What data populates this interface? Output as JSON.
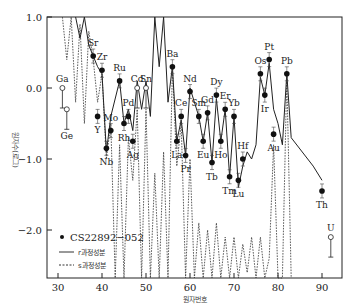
{
  "chart_data": {
    "type": "scatter",
    "title": "",
    "xlabel": "원자번호",
    "ylabel": "원자수(로그)",
    "xlim": [
      28,
      95
    ],
    "ylim": [
      -2.7,
      1.0
    ],
    "x_ticks": [
      30,
      40,
      50,
      60,
      70,
      80,
      90
    ],
    "y_ticks": [
      1.0,
      0.0,
      -1.0,
      -2.0
    ],
    "y_tick_labels": [
      "1.0",
      "0.0",
      "−1.0",
      "−2.0"
    ],
    "grid": false,
    "legend": {
      "position": "lower-left",
      "entries": [
        {
          "label": "CS22892−052",
          "style": "filled-dot"
        },
        {
          "label": "r과정성분",
          "style": "solid-line"
        },
        {
          "label": "s과정성분",
          "style": "dashed-line"
        }
      ]
    },
    "series": [
      {
        "name": "CS22892−052",
        "points": [
          {
            "el": "Ga",
            "z": 31,
            "v": 0.0,
            "open": true
          },
          {
            "el": "Ge",
            "z": 32,
            "v": -0.3,
            "open": true
          },
          {
            "el": "Sr",
            "z": 38,
            "v": 0.45
          },
          {
            "el": "Y",
            "z": 39,
            "v": -0.4
          },
          {
            "el": "Zr",
            "z": 40,
            "v": 0.25
          },
          {
            "el": "Nb",
            "z": 41,
            "v": -0.85
          },
          {
            "el": "Mo",
            "z": 42,
            "v": -0.6
          },
          {
            "el": "Ru",
            "z": 44,
            "v": 0.1
          },
          {
            "el": "Rh",
            "z": 45,
            "v": -0.5
          },
          {
            "el": "Pd",
            "z": 46,
            "v": -0.4
          },
          {
            "el": "Ag",
            "z": 47,
            "v": -0.75
          },
          {
            "el": "Cd",
            "z": 48,
            "v": 0.0,
            "open": true
          },
          {
            "el": "Sn",
            "z": 50,
            "v": 0.0,
            "open": true
          },
          {
            "el": "Ba",
            "z": 56,
            "v": 0.3
          },
          {
            "el": "La",
            "z": 57,
            "v": -0.75
          },
          {
            "el": "Ce",
            "z": 58,
            "v": -0.4
          },
          {
            "el": "Pr",
            "z": 59,
            "v": -0.95
          },
          {
            "el": "Nd",
            "z": 60,
            "v": -0.05
          },
          {
            "el": "Sm",
            "z": 62,
            "v": -0.4
          },
          {
            "el": "Eu",
            "z": 63,
            "v": -0.75
          },
          {
            "el": "Gd",
            "z": 64,
            "v": -0.35
          },
          {
            "el": "Tb",
            "z": 65,
            "v": -1.05
          },
          {
            "el": "Dy",
            "z": 66,
            "v": -0.1
          },
          {
            "el": "Ho",
            "z": 67,
            "v": -0.75
          },
          {
            "el": "Er",
            "z": 68,
            "v": -0.3
          },
          {
            "el": "Tm",
            "z": 69,
            "v": -1.25
          },
          {
            "el": "Yb",
            "z": 70,
            "v": -0.4
          },
          {
            "el": "Lu",
            "z": 71,
            "v": -1.3
          },
          {
            "el": "Hf",
            "z": 72,
            "v": -1.0
          },
          {
            "el": "Os",
            "z": 76,
            "v": 0.2
          },
          {
            "el": "Ir",
            "z": 77,
            "v": -0.1
          },
          {
            "el": "Pt",
            "z": 78,
            "v": 0.4
          },
          {
            "el": "Au",
            "z": 79,
            "v": -0.65
          },
          {
            "el": "Pb",
            "z": 82,
            "v": 0.2
          },
          {
            "el": "Th",
            "z": 90,
            "v": -1.45
          },
          {
            "el": "U",
            "z": 92,
            "v": -2.1,
            "open": true
          }
        ]
      },
      {
        "name": "r과정성분",
        "type": "line",
        "x": [
          34,
          35,
          36,
          37,
          38,
          39,
          40,
          41,
          42,
          44,
          45,
          46,
          47,
          48,
          49,
          50,
          51,
          52,
          53,
          54,
          55,
          56,
          57,
          58,
          59,
          60,
          62,
          63,
          64,
          65,
          66,
          67,
          68,
          69,
          70,
          71,
          72,
          73,
          74,
          75,
          76,
          77,
          78,
          79,
          80,
          81,
          82,
          83,
          88,
          90
        ],
        "y": [
          1.0,
          0.7,
          1.0,
          0.6,
          0.45,
          0.3,
          0.2,
          -0.9,
          -0.4,
          0.1,
          -0.5,
          -0.3,
          -0.6,
          0.1,
          -0.3,
          0.1,
          -0.4,
          1.0,
          0.3,
          1.0,
          -0.2,
          0.3,
          -0.75,
          -0.45,
          -0.95,
          0.0,
          -0.4,
          -0.75,
          -0.35,
          -1.05,
          -0.15,
          -0.75,
          -0.3,
          -1.25,
          -0.4,
          -1.4,
          -1.1,
          -0.9,
          -1.0,
          -0.8,
          0.15,
          -0.1,
          0.35,
          -0.3,
          -0.5,
          -0.8,
          0.2,
          -0.7,
          -1.1,
          -1.3
        ]
      },
      {
        "name": "s과정성분",
        "type": "line",
        "style": "dashed",
        "note": "oscillating curve, values below plot range for many elements"
      }
    ]
  }
}
